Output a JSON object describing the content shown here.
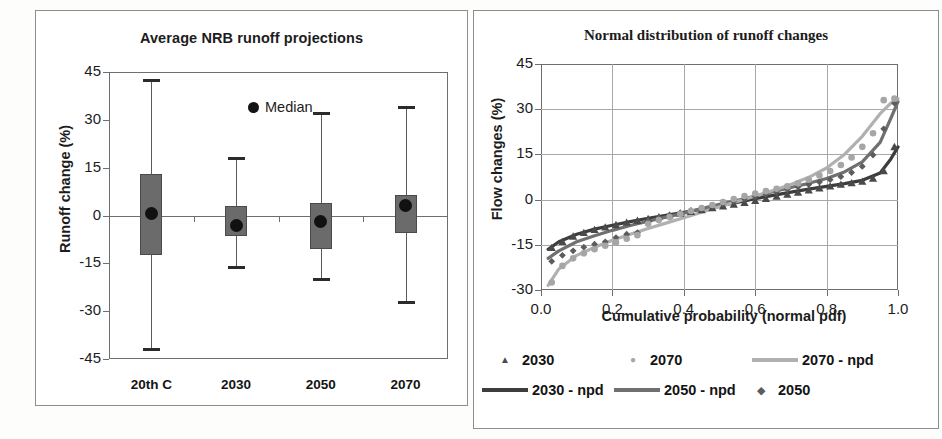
{
  "figure": {
    "panels": [
      "box-plot-panel",
      "normal-distribution-panel"
    ]
  },
  "left_panel": {
    "title": "Average NRB runoff projections",
    "ylabel": "Runoff change (%)",
    "yticks": [
      "45",
      "30",
      "15",
      "0",
      "-15",
      "-30",
      "-45"
    ],
    "categories": [
      "20th C",
      "2030",
      "2050",
      "2070"
    ],
    "legend": {
      "median_label": "Median"
    }
  },
  "right_panel": {
    "title": "Normal distribution of runoff changes",
    "ylabel": "Flow changes (%)",
    "xlabel": "Cumulative probability (normal pdf)",
    "yticks": [
      "45",
      "30",
      "15",
      "0",
      "-15",
      "-30"
    ],
    "xticks": [
      "0.0",
      "0.2",
      "0.4",
      "0.6",
      "0.8",
      "1.0"
    ],
    "legend": [
      {
        "label": "2030",
        "kind": "marker",
        "marker": "triangle",
        "color": "#4a4a4a"
      },
      {
        "label": "2070",
        "kind": "marker",
        "marker": "circle",
        "color": "#a6a6a6"
      },
      {
        "label": "2070 - npd",
        "kind": "line",
        "color": "#b0b0b0"
      },
      {
        "label": "2030 - npd",
        "kind": "line",
        "color": "#3d3d3d"
      },
      {
        "label": "2050 - npd",
        "kind": "line",
        "color": "#707070"
      },
      {
        "label": "2050",
        "kind": "marker",
        "marker": "diamond",
        "color": "#5c5c5c"
      }
    ]
  },
  "chart_data": [
    {
      "type": "box",
      "title": "Average NRB runoff projections",
      "xlabel": "",
      "ylabel": "Runoff change (%)",
      "ylim": [
        -45,
        45
      ],
      "ytick_values": [
        45,
        30,
        15,
        0,
        -15,
        -30,
        -45
      ],
      "grid": false,
      "legend": [
        "Median"
      ],
      "categories": [
        "20th C",
        "2030",
        "2050",
        "2070"
      ],
      "boxes": [
        {
          "category": "20th C",
          "whisker_high": 42.5,
          "q3": 13.0,
          "median": 0.5,
          "q1": -12.5,
          "whisker_low": -42.0
        },
        {
          "category": "2030",
          "whisker_high": 18.0,
          "q3": 3.0,
          "median": -3.0,
          "q1": -6.5,
          "whisker_low": -16.0
        },
        {
          "category": "2050",
          "whisker_high": 32.0,
          "q3": 4.0,
          "median": -2.0,
          "q1": -10.5,
          "whisker_low": -20.0
        },
        {
          "category": "2070",
          "whisker_high": 34.0,
          "q3": 6.5,
          "median": 3.0,
          "q1": -5.5,
          "whisker_low": -27.0
        }
      ]
    },
    {
      "type": "scatter",
      "title": "Normal distribution of runoff changes",
      "xlabel": "Cumulative probability (normal pdf)",
      "ylabel": "Flow changes (%)",
      "xlim": [
        0.0,
        1.0
      ],
      "ylim": [
        -30,
        45
      ],
      "xtick_values": [
        0.0,
        0.2,
        0.4,
        0.6,
        0.8,
        1.0
      ],
      "ytick_values": [
        45,
        30,
        15,
        0,
        -15,
        -30
      ],
      "grid": true,
      "legend_position": "below",
      "series": [
        {
          "name": "2030",
          "kind": "markers",
          "marker": "triangle",
          "color": "#4a4a4a",
          "x": [
            0.03,
            0.06,
            0.09,
            0.12,
            0.15,
            0.18,
            0.21,
            0.24,
            0.27,
            0.3,
            0.33,
            0.36,
            0.39,
            0.42,
            0.45,
            0.48,
            0.51,
            0.54,
            0.57,
            0.6,
            0.63,
            0.66,
            0.69,
            0.72,
            0.75,
            0.78,
            0.81,
            0.84,
            0.87,
            0.9,
            0.93,
            0.96,
            0.99
          ],
          "y": [
            -16.0,
            -14.0,
            -12.2,
            -11.0,
            -10.0,
            -9.2,
            -8.4,
            -7.6,
            -7.0,
            -6.4,
            -5.8,
            -5.2,
            -4.6,
            -4.0,
            -3.4,
            -2.8,
            -2.2,
            -1.6,
            -1.0,
            -0.4,
            0.3,
            1.0,
            1.7,
            2.4,
            3.1,
            3.8,
            4.4,
            5.0,
            5.5,
            6.0,
            7.0,
            9.5,
            17.5
          ]
        },
        {
          "name": "2050",
          "kind": "markers",
          "marker": "diamond",
          "color": "#5c5c5c",
          "x": [
            0.03,
            0.06,
            0.09,
            0.12,
            0.15,
            0.18,
            0.21,
            0.24,
            0.27,
            0.3,
            0.33,
            0.36,
            0.39,
            0.42,
            0.45,
            0.48,
            0.51,
            0.54,
            0.57,
            0.6,
            0.63,
            0.66,
            0.69,
            0.72,
            0.75,
            0.78,
            0.81,
            0.84,
            0.87,
            0.9,
            0.93,
            0.96,
            0.99
          ],
          "y": [
            -20.5,
            -18.5,
            -17.0,
            -15.8,
            -14.8,
            -14.0,
            -12.6,
            -11.5,
            -11.0,
            -7.0,
            -6.0,
            -5.2,
            -4.4,
            -3.6,
            -2.8,
            -2.0,
            -1.3,
            -0.6,
            0.2,
            1.0,
            1.8,
            2.6,
            3.4,
            4.2,
            5.0,
            5.8,
            6.6,
            7.6,
            9.0,
            11.0,
            14.8,
            23.5,
            32.0
          ]
        },
        {
          "name": "2070",
          "kind": "markers",
          "marker": "circle",
          "color": "#a6a6a6",
          "x": [
            0.03,
            0.06,
            0.09,
            0.12,
            0.15,
            0.18,
            0.21,
            0.24,
            0.27,
            0.3,
            0.33,
            0.36,
            0.39,
            0.42,
            0.45,
            0.48,
            0.51,
            0.54,
            0.57,
            0.6,
            0.63,
            0.66,
            0.69,
            0.72,
            0.75,
            0.78,
            0.81,
            0.84,
            0.87,
            0.9,
            0.93,
            0.96,
            0.99
          ],
          "y": [
            -27.5,
            -22.0,
            -19.5,
            -17.8,
            -16.5,
            -15.3,
            -14.2,
            -13.0,
            -11.8,
            -8.0,
            -6.8,
            -5.8,
            -4.8,
            -3.8,
            -2.8,
            -1.8,
            -0.8,
            0.2,
            1.2,
            2.0,
            2.8,
            3.6,
            4.4,
            5.4,
            6.6,
            8.0,
            9.5,
            11.5,
            14.0,
            17.5,
            22.0,
            33.0,
            33.5
          ]
        },
        {
          "name": "2030 - npd",
          "kind": "line",
          "color": "#3d3d3d",
          "x": [
            0.02,
            0.05,
            0.1,
            0.15,
            0.2,
            0.25,
            0.3,
            0.35,
            0.4,
            0.45,
            0.5,
            0.55,
            0.6,
            0.65,
            0.7,
            0.75,
            0.8,
            0.85,
            0.9,
            0.95,
            0.98,
            1.0
          ],
          "y": [
            -16.5,
            -14.0,
            -11.5,
            -9.8,
            -8.5,
            -7.3,
            -6.2,
            -5.2,
            -4.2,
            -3.2,
            -2.0,
            -0.9,
            0.3,
            1.4,
            2.5,
            3.5,
            4.4,
            5.3,
            6.4,
            8.8,
            13.5,
            17.5
          ]
        },
        {
          "name": "2050 - npd",
          "kind": "line",
          "color": "#707070",
          "x": [
            0.02,
            0.05,
            0.1,
            0.15,
            0.2,
            0.25,
            0.3,
            0.35,
            0.4,
            0.45,
            0.5,
            0.55,
            0.6,
            0.65,
            0.7,
            0.75,
            0.8,
            0.85,
            0.9,
            0.95,
            0.98,
            1.0
          ],
          "y": [
            -19.5,
            -17.0,
            -14.0,
            -12.0,
            -10.2,
            -8.6,
            -7.2,
            -5.8,
            -4.5,
            -3.0,
            -1.6,
            -0.2,
            1.2,
            2.6,
            4.0,
            5.4,
            7.0,
            9.2,
            12.5,
            19.0,
            27.0,
            32.5
          ]
        },
        {
          "name": "2070 - npd",
          "kind": "line",
          "color": "#b0b0b0",
          "x": [
            0.02,
            0.05,
            0.1,
            0.15,
            0.2,
            0.25,
            0.3,
            0.35,
            0.4,
            0.45,
            0.5,
            0.55,
            0.6,
            0.65,
            0.7,
            0.75,
            0.8,
            0.85,
            0.9,
            0.95,
            0.98,
            1.0
          ],
          "y": [
            -28.5,
            -23.0,
            -18.5,
            -15.8,
            -13.5,
            -11.5,
            -9.6,
            -7.8,
            -6.0,
            -4.2,
            -2.4,
            -0.6,
            1.2,
            3.0,
            5.0,
            7.4,
            10.5,
            15.0,
            21.0,
            28.5,
            32.0,
            33.5
          ]
        }
      ]
    }
  ]
}
